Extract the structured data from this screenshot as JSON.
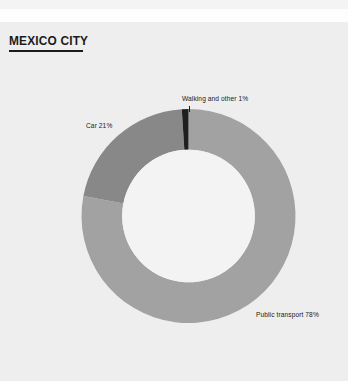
{
  "figure": {
    "title": "MEXICO CITY",
    "background_color": "#eeeeee",
    "title_color": "#1b1b1b"
  },
  "chart_data": {
    "type": "pie",
    "variant": "donut",
    "title": "MEXICO CITY",
    "subtitle": "",
    "xlabel": "",
    "ylabel": "",
    "units": "percent",
    "total": 100,
    "inner_radius_ratio": 0.62,
    "start_angle_deg": 0,
    "direction": "clockwise",
    "legend": "none",
    "grid": false,
    "categories": [
      "Public transport",
      "Car",
      "Walking and other"
    ],
    "values": [
      78,
      21,
      1
    ],
    "colors": [
      "#a2a2a2",
      "#888888",
      "#1f1f1f"
    ],
    "labels": [
      "Public transport 78%",
      "Car 21%",
      "Walking and other 1%"
    ],
    "slices": [
      {
        "name": "Public transport",
        "value": 78,
        "label": "Public transport 78%",
        "color": "#a2a2a2",
        "label_position": "bottom-right"
      },
      {
        "name": "Car",
        "value": 21,
        "label": "Car 21%",
        "color": "#888888",
        "label_position": "top-left"
      },
      {
        "name": "Walking and other",
        "value": 1,
        "label": "Walking and other 1%",
        "color": "#1f1f1f",
        "label_position": "top"
      }
    ]
  }
}
